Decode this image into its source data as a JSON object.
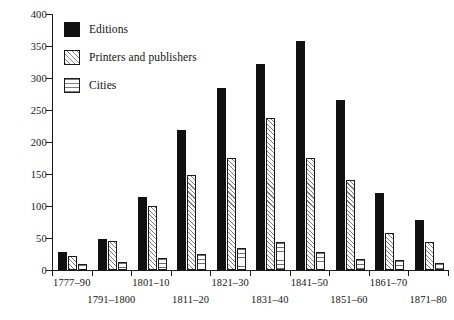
{
  "chart_data": {
    "type": "bar",
    "title": "",
    "subtitle": "",
    "xlabel": "",
    "ylabel": "",
    "ylim": [
      0,
      400
    ],
    "ytick_step": 50,
    "yticks": [
      0,
      50,
      100,
      150,
      200,
      250,
      300,
      350,
      400
    ],
    "grid": false,
    "legend_position": "top-left",
    "orientation": "vertical",
    "grouping": "grouped",
    "categories": [
      "1777–90",
      "1791–1800",
      "1801–10",
      "1811–20",
      "1821–30",
      "1831–40",
      "1841–50",
      "1851–60",
      "1861–70",
      "1871–80"
    ],
    "series": [
      {
        "name": "Editions",
        "fill": "solid-black",
        "color": "#111111",
        "values": [
          28,
          48,
          114,
          218,
          284,
          322,
          358,
          266,
          121,
          78
        ]
      },
      {
        "name": "Printers and publishers",
        "fill": "diagonal-hatch",
        "color": "#ffffff",
        "values": [
          22,
          45,
          100,
          148,
          175,
          238,
          175,
          140,
          58,
          43
        ]
      },
      {
        "name": "Cities",
        "fill": "horizontal-hatch",
        "color": "#ffffff",
        "values": [
          10,
          12,
          18,
          25,
          34,
          43,
          28,
          17,
          16,
          11
        ]
      }
    ]
  },
  "legend": {
    "items": [
      {
        "label": "Editions"
      },
      {
        "label": "Printers and publishers"
      },
      {
        "label": "Cities"
      }
    ]
  },
  "axes": {
    "y": {
      "labels": [
        "0",
        "50",
        "100",
        "150",
        "200",
        "250",
        "300",
        "350",
        "400"
      ]
    },
    "x": {
      "labels": [
        "1777–90",
        "1791–1800",
        "1801–10",
        "1811–20",
        "1821–30",
        "1831–40",
        "1841–50",
        "1851–60",
        "1861–70",
        "1871–80"
      ]
    }
  },
  "colors": {
    "axis": "#1a1a1a",
    "text": "#141414",
    "series_editions": "#111111",
    "background": "#ffffff"
  }
}
